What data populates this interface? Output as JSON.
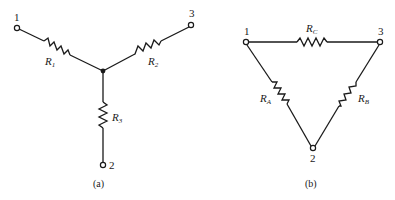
{
  "figures": [
    {
      "id": "a",
      "caption": "(a)",
      "type": "wye (Y) resistor network",
      "nodes": {
        "n1": "1",
        "n2": "2",
        "n3": "3"
      },
      "resistors": [
        {
          "name": "R",
          "sub": "1",
          "between": [
            "1",
            "center"
          ]
        },
        {
          "name": "R",
          "sub": "2",
          "between": [
            "3",
            "center"
          ]
        },
        {
          "name": "R",
          "sub": "3",
          "between": [
            "2",
            "center"
          ]
        }
      ]
    },
    {
      "id": "b",
      "caption": "(b)",
      "type": "delta (Δ) resistor network",
      "nodes": {
        "n1": "1",
        "n2": "2",
        "n3": "3"
      },
      "resistors": [
        {
          "name": "R",
          "sub": "C",
          "between": [
            "1",
            "3"
          ]
        },
        {
          "name": "R",
          "sub": "A",
          "between": [
            "1",
            "2"
          ]
        },
        {
          "name": "R",
          "sub": "B",
          "between": [
            "3",
            "2"
          ]
        }
      ]
    }
  ],
  "colors": {
    "ink": "#1a1a1a",
    "background": "#ffffff"
  }
}
